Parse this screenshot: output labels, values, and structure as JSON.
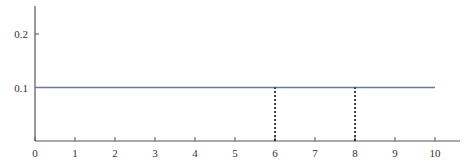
{
  "chart_data": {
    "type": "line",
    "title": "",
    "xlabel": "",
    "ylabel": "",
    "xlim": [
      0,
      10.6
    ],
    "ylim": [
      0,
      0.25
    ],
    "grid": false,
    "legend": null,
    "x_ticks": [
      "0",
      "1",
      "2",
      "3",
      "4",
      "5",
      "6",
      "7",
      "8",
      "9",
      "10"
    ],
    "y_ticks": [
      "0.1",
      "0.2"
    ],
    "series": [
      {
        "name": "uniform density",
        "x": [
          0,
          10
        ],
        "y": [
          0.1,
          0.1
        ],
        "color": "#6a7a9a",
        "style": "solid"
      }
    ],
    "annotations": [
      {
        "type": "vline",
        "x": 6,
        "y_from": 0,
        "y_to": 0.1,
        "style": "dotted",
        "color": "#111111"
      },
      {
        "type": "vline",
        "x": 8,
        "y_from": 0,
        "y_to": 0.1,
        "style": "dotted",
        "color": "#111111"
      }
    ]
  }
}
